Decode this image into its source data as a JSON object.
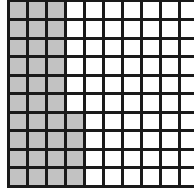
{
  "diagram": {
    "type": "hundred-grid",
    "rows": 10,
    "cols": 10,
    "shaded_color": "#c2c2c2",
    "unshaded_color": "#ffffff",
    "line_color": "#1a1a1a",
    "shaded_cells_per_row": [
      3,
      3,
      3,
      3,
      3,
      3,
      4,
      4,
      4,
      4
    ],
    "shaded_total": 34
  }
}
